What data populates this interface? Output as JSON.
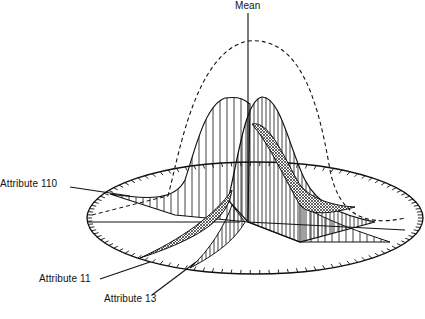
{
  "diagram": {
    "title": "",
    "labels": {
      "mean": "Mean",
      "attribute_110": "Attribute 110",
      "attribute_11": "Attribute 11",
      "attribute_13": "Attribute 13"
    },
    "colors": {
      "ink": "#111111",
      "background": "#ffffff"
    }
  }
}
